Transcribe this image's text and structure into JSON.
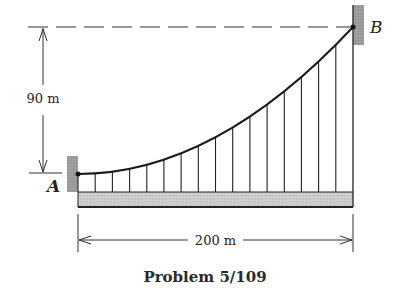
{
  "title": "Problem 5/109",
  "points": {
    "A": {
      "label": "A"
    },
    "B": {
      "label": "B"
    }
  },
  "dimensions": {
    "vertical": {
      "label": "90 m",
      "value": 90,
      "unit": "m"
    },
    "horizontal": {
      "label": "200 m",
      "value": 200,
      "unit": "m"
    }
  },
  "structure": {
    "type": "suspension cable with vertical hangers supporting horizontal deck",
    "cable_shape": "parabolic",
    "hanger_count": 17
  },
  "colors": {
    "line": "#222222",
    "support_fill": "#9a9a9a",
    "deck_fill": "#c8c8c8"
  }
}
